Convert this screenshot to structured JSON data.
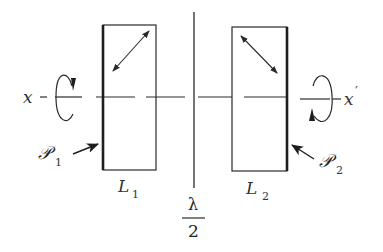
{
  "diagram": {
    "type": "optical-setup",
    "axis": {
      "left_label": "x",
      "right_label": "x",
      "right_label_prime": "′"
    },
    "center_plate": {
      "label_numerator": "λ",
      "label_denominator": "2"
    },
    "plates": [
      {
        "name": "L",
        "subscript": "1",
        "polarization_direction": "diagonal-up-right"
      },
      {
        "name": "L",
        "subscript": "2",
        "polarization_direction": "diagonal-down-right"
      }
    ],
    "polarizer_labels": [
      {
        "symbol": "𝒫",
        "subscript": "1"
      },
      {
        "symbol": "𝒫",
        "subscript": "2"
      }
    ],
    "colors": {
      "ink": "#2a2a2a",
      "background": "#ffffff"
    }
  }
}
